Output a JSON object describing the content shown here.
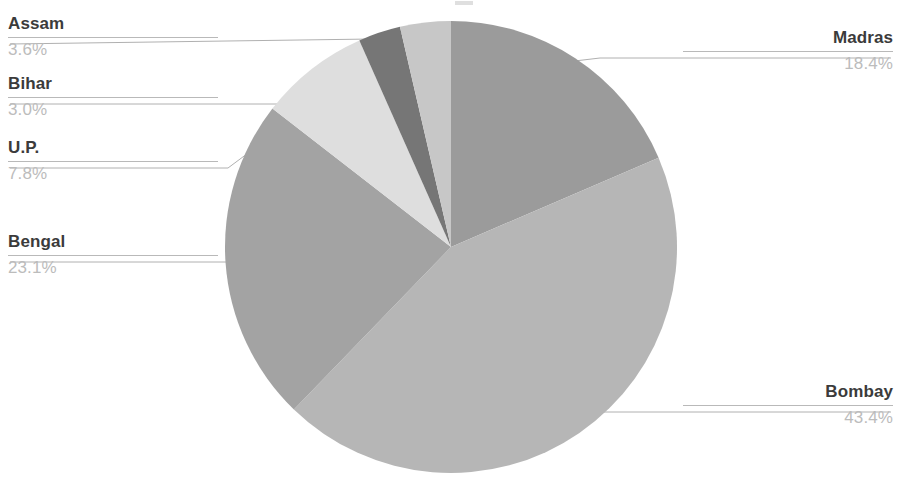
{
  "chart_data": {
    "type": "pie",
    "title": "",
    "categories": [
      "Madras",
      "Bombay",
      "Bengal",
      "U.P.",
      "Bihar",
      "Assam"
    ],
    "values": [
      18.4,
      43.4,
      23.1,
      7.8,
      3.0,
      3.6
    ],
    "value_unit": "%",
    "value_labels": [
      "18.4%",
      "43.4%",
      "23.1%",
      "7.8%",
      "3.0%",
      "3.6%"
    ],
    "start_angle_deg": 0,
    "direction": "clockwise",
    "legend": "none",
    "labels_position": "outside-with-leader-lines",
    "grid": false,
    "slice_colors": [
      "#9b9b9b",
      "#b6b6b6",
      "#a3a3a3",
      "#dedede",
      "#767676",
      "#c7c7c7"
    ]
  },
  "slices": [
    {
      "name": "Madras",
      "value": "18.4%",
      "color": "#9b9b9b"
    },
    {
      "name": "Bombay",
      "value": "43.4%",
      "color": "#b6b6b6"
    },
    {
      "name": "Bengal",
      "value": "23.1%",
      "color": "#a3a3a3"
    },
    {
      "name": "U.P.",
      "value": "7.8%",
      "color": "#dedede"
    },
    {
      "name": "Bihar",
      "value": "3.0%",
      "color": "#767676"
    },
    {
      "name": "Assam",
      "value": "3.6%",
      "color": "#c7c7c7"
    }
  ],
  "style": {
    "label_text_color": "#3b3b3b",
    "value_text_color": "#bcbcbc",
    "leader_line_color": "#b9b9b9",
    "background": "#ffffff"
  }
}
